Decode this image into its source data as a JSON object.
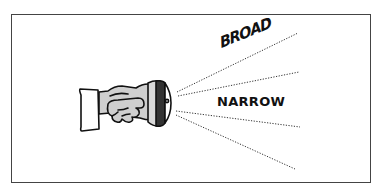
{
  "diagram": {
    "labels": {
      "broad": "BROAD",
      "narrow": "NARROW"
    },
    "beams": [
      {
        "name": "broad-upper",
        "style": "dotted"
      },
      {
        "name": "narrow-upper",
        "style": "dotted"
      },
      {
        "name": "narrow-lower",
        "style": "dotted"
      },
      {
        "name": "broad-lower",
        "style": "dotted"
      }
    ],
    "colors": {
      "frame": "#444444",
      "ink": "#111111",
      "handle_fill": "#cfcfcf",
      "lens_ring": "#333333"
    }
  }
}
